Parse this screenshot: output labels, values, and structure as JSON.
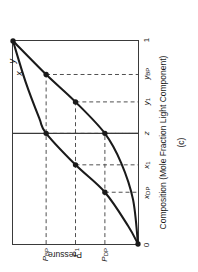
{
  "figure": {
    "caption": "(c)",
    "xlabel": "Composition (Mole Fraction Light Component)",
    "ylabel": "Pressure",
    "curve_labels": {
      "liquid": "x",
      "vapor": "y"
    }
  },
  "axes": {
    "x_ticks": [
      {
        "id": "x0",
        "text": "0",
        "sub": "",
        "value": 0.0
      },
      {
        "id": "xdp",
        "text": "x",
        "sub": "DP",
        "value": 0.255
      },
      {
        "id": "x1",
        "text": "x",
        "sub": "1",
        "value": 0.39
      },
      {
        "id": "z",
        "text": "z",
        "sub": "",
        "value": 0.545
      },
      {
        "id": "y1",
        "text": "y",
        "sub": "1",
        "value": 0.7
      },
      {
        "id": "ybp",
        "text": "y",
        "sub": "BP",
        "value": 0.835
      },
      {
        "id": "x1end",
        "text": "1",
        "sub": "",
        "value": 1.0
      }
    ],
    "y_ticks": [
      {
        "id": "pdp",
        "text": "P",
        "sub": "DP",
        "value": 0.265
      },
      {
        "id": "p1",
        "text": "P",
        "sub": "1",
        "value": 0.5
      },
      {
        "id": "pbp",
        "text": "P",
        "sub": "BP",
        "value": 0.735
      }
    ],
    "xlim": [
      0,
      1
    ],
    "ylim": [
      0,
      1
    ]
  },
  "chart_data": {
    "type": "line",
    "title": "",
    "xlabel": "Composition (Mole Fraction Light Component)",
    "ylabel": "Pressure",
    "xlim": [
      0,
      1
    ],
    "ylim": [
      0,
      1
    ],
    "grid": false,
    "legend": "none",
    "series": [
      {
        "name": "x",
        "role": "bubble-point (liquid) curve",
        "points": [
          [
            1.0,
            1.0
          ],
          [
            0.8,
            0.9
          ],
          [
            0.62,
            0.79
          ],
          [
            0.545,
            0.735
          ],
          [
            0.39,
            0.5
          ],
          [
            0.255,
            0.265
          ],
          [
            0.09,
            0.08
          ],
          [
            0.0,
            0.0
          ]
        ]
      },
      {
        "name": "y",
        "role": "dew-point (vapor) curve",
        "points": [
          [
            1.0,
            1.0
          ],
          [
            0.835,
            0.735
          ],
          [
            0.7,
            0.5
          ],
          [
            0.545,
            0.265
          ],
          [
            0.4,
            0.135
          ],
          [
            0.22,
            0.04
          ],
          [
            0.0,
            0.0
          ]
        ]
      }
    ],
    "markers": [
      {
        "name": "top-vertex",
        "x": 1.0,
        "y": 1.0,
        "on": "both"
      },
      {
        "name": "bottom-vertex",
        "x": 0.0,
        "y": 0.0,
        "on": "both"
      },
      {
        "name": "x-bp",
        "x": 0.545,
        "y": 0.735,
        "on": "x"
      },
      {
        "name": "x-p1",
        "x": 0.39,
        "y": 0.5,
        "on": "x"
      },
      {
        "name": "x-dp",
        "x": 0.255,
        "y": 0.265,
        "on": "x"
      },
      {
        "name": "y-bp",
        "x": 0.835,
        "y": 0.735,
        "on": "y"
      },
      {
        "name": "y-p1",
        "x": 0.7,
        "y": 0.5,
        "on": "y"
      },
      {
        "name": "y-dp",
        "x": 0.545,
        "y": 0.265,
        "on": "y"
      }
    ],
    "tie_lines": [
      {
        "pressure": 0.735,
        "x": 0.545,
        "y": 0.835,
        "label": "P_BP"
      },
      {
        "pressure": 0.5,
        "x": 0.39,
        "y": 0.7,
        "label": "P_1"
      },
      {
        "pressure": 0.265,
        "x": 0.255,
        "y": 0.545,
        "label": "P_DP"
      }
    ],
    "feed_line": {
      "z": 0.545,
      "description": "vertical solid line at overall composition z"
    },
    "annotations": [
      {
        "text": "x",
        "x": 0.84,
        "y": 0.9,
        "note": "liquid curve label"
      },
      {
        "text": "y",
        "x": 0.9,
        "y": 0.955,
        "note": "vapor curve label"
      }
    ]
  },
  "colors": {
    "curve": "#1a1a1a",
    "frame": "#3a3a3a",
    "dashed": "#4d4d4d",
    "text": "#1b1b1b",
    "background": "#ffffff"
  }
}
